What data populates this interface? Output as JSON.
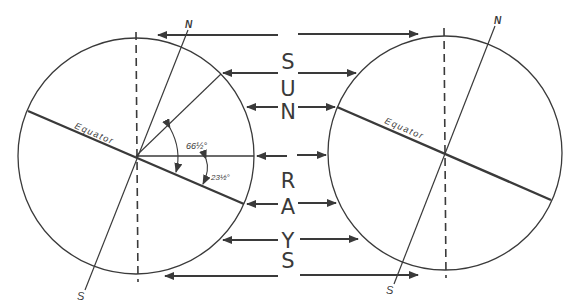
{
  "diagram": {
    "sun_letters": [
      "S",
      "U",
      "N",
      "R",
      "A",
      "Y",
      "S"
    ],
    "left_globe": {
      "equator_label": "Equator",
      "north_label": "N",
      "south_label": "S",
      "angle_upper": "66½°",
      "angle_lower": "23½°"
    },
    "right_globe": {
      "equator_label": "Equator",
      "north_label": "N",
      "south_label": "S"
    },
    "colors": {
      "ink": "#3a3a3a",
      "background": "#ffffff"
    }
  }
}
